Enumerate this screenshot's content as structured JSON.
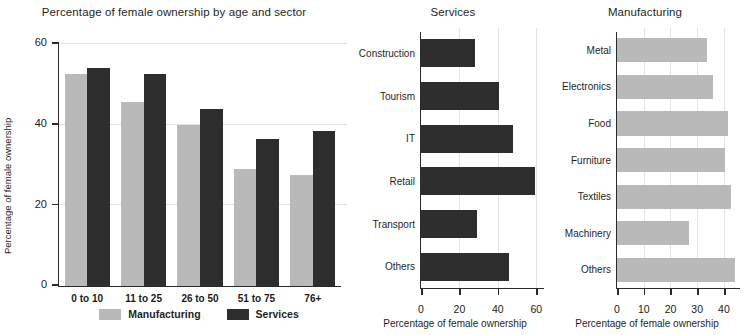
{
  "colors": {
    "manufacturing": "#b9b9b9",
    "services": "#2e2e2e",
    "axis": "#2a2a2a",
    "gridline": "#e3e3e3",
    "background": "#ffffff"
  },
  "chart_data": [
    {
      "type": "bar",
      "title": "Percentage of female ownership by age and sector",
      "xlabel": "",
      "ylabel": "Percentage of female ownership",
      "categories": [
        "0 to 10",
        "11 to 25",
        "26 to 50",
        "51 to 75",
        "76+"
      ],
      "series": [
        {
          "name": "Manufacturing",
          "color": "#b9b9b9",
          "values": [
            52.5,
            45.5,
            40,
            29,
            27.5
          ]
        },
        {
          "name": "Services",
          "color": "#2e2e2e",
          "values": [
            54,
            52.5,
            44,
            36.5,
            38.5
          ]
        }
      ],
      "ylim": [
        0,
        60
      ],
      "yticks": [
        0,
        20,
        40,
        60
      ],
      "ytick_labels": [
        "0",
        "20",
        "40",
        "60"
      ],
      "grid": true,
      "legend": {
        "position": "bottom",
        "entries": [
          "Manufacturing",
          "Services"
        ]
      }
    },
    {
      "type": "bar",
      "orientation": "horizontal",
      "title": "Services",
      "xlabel": "Percentage of female ownership",
      "ylabel": "",
      "categories": [
        "Construction",
        "Tourism",
        "IT",
        "Retail",
        "Transport",
        "Others"
      ],
      "values": [
        28,
        40.5,
        48,
        59.5,
        29,
        46
      ],
      "color": "#2e2e2e",
      "xlim": [
        0,
        64
      ],
      "xticks": [
        0,
        20,
        40,
        60
      ],
      "xtick_labels": [
        "0",
        "20",
        "40",
        "60"
      ],
      "grid": true
    },
    {
      "type": "bar",
      "orientation": "horizontal",
      "title": "Manufacturing",
      "xlabel": "Percentage of female ownership",
      "ylabel": "",
      "categories": [
        "Metal",
        "Electronics",
        "Food",
        "Furniture",
        "Textiles",
        "Machinery",
        "Others"
      ],
      "values": [
        33.5,
        36,
        41.5,
        40.5,
        42.5,
        27,
        44
      ],
      "color": "#b9b9b9",
      "xlim": [
        0,
        46
      ],
      "xticks": [
        0,
        10,
        20,
        30,
        40
      ],
      "xtick_labels": [
        "0",
        "10",
        "20",
        "30",
        "40"
      ],
      "grid": true
    }
  ]
}
